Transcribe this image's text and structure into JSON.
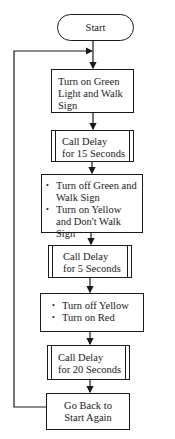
{
  "diagram": {
    "type": "flowchart",
    "nodes": [
      {
        "id": "start",
        "shape": "terminal",
        "label": "Start"
      },
      {
        "id": "green_on",
        "shape": "process",
        "lines": [
          "Turn on Green",
          "Light and Walk",
          "Sign"
        ]
      },
      {
        "id": "delay15",
        "shape": "subroutine",
        "lines": [
          "Call Delay",
          "for 15 Seconds"
        ]
      },
      {
        "id": "yellow_on",
        "shape": "process",
        "bullets": [
          "Turn off Green and Walk Sign",
          "Turn on Yellow and Don't Walk Sign"
        ]
      },
      {
        "id": "delay5",
        "shape": "subroutine",
        "lines": [
          "Call Delay",
          "for 5 Seconds"
        ]
      },
      {
        "id": "red_on",
        "shape": "process",
        "bullets": [
          "Turn off Yellow",
          "Turn on Red"
        ]
      },
      {
        "id": "delay20",
        "shape": "subroutine",
        "lines": [
          "Call Delay",
          "for 20 Seconds"
        ]
      },
      {
        "id": "go_back",
        "shape": "process",
        "lines": [
          "Go Back to",
          "Start Again"
        ]
      }
    ],
    "edges": [
      {
        "from": "start",
        "to": "green_on"
      },
      {
        "from": "green_on",
        "to": "delay15"
      },
      {
        "from": "delay15",
        "to": "yellow_on"
      },
      {
        "from": "yellow_on",
        "to": "delay5"
      },
      {
        "from": "delay5",
        "to": "red_on"
      },
      {
        "from": "red_on",
        "to": "delay20"
      },
      {
        "from": "delay20",
        "to": "go_back"
      },
      {
        "from": "go_back",
        "to": "green_on",
        "kind": "loop"
      }
    ]
  }
}
